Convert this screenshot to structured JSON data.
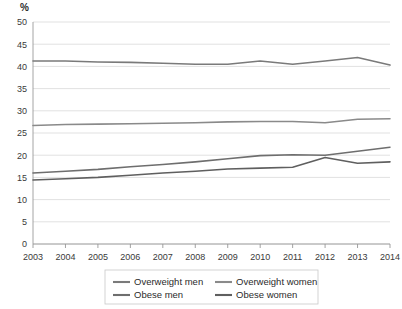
{
  "chart_data": {
    "type": "line",
    "title": "",
    "subtitle": "",
    "xlabel": "",
    "ylabel": "%",
    "unit_label": "%",
    "x": [
      2003,
      2004,
      2005,
      2006,
      2007,
      2008,
      2009,
      2010,
      2011,
      2012,
      2013,
      2014
    ],
    "categories": [
      "2003",
      "2004",
      "2005",
      "2006",
      "2007",
      "2008",
      "2009",
      "2010",
      "2011",
      "2012",
      "2013",
      "2014"
    ],
    "xlim": [
      2003,
      2014
    ],
    "ylim": [
      0,
      50
    ],
    "yticks": [
      0,
      5,
      10,
      15,
      20,
      25,
      30,
      35,
      40,
      45,
      50
    ],
    "ytick_labels": [
      "0",
      "5",
      "10",
      "15",
      "20",
      "25",
      "30",
      "35",
      "40",
      "45",
      "50"
    ],
    "grid": true,
    "grid_axis": "y",
    "legend_position": "bottom",
    "series": [
      {
        "name": "Overweight men",
        "color": "#7a7a7a",
        "values": [
          41.2,
          41.2,
          41.0,
          40.9,
          40.7,
          40.5,
          40.5,
          41.2,
          40.5,
          41.2,
          42.0,
          40.3
        ]
      },
      {
        "name": "Overweight women",
        "color": "#8a8a8a",
        "values": [
          26.7,
          26.9,
          27.0,
          27.1,
          27.2,
          27.3,
          27.5,
          27.6,
          27.6,
          27.3,
          28.1,
          28.2
        ]
      },
      {
        "name": "Obese men",
        "color": "#6e6e6e",
        "values": [
          16.0,
          16.4,
          16.8,
          17.4,
          17.9,
          18.5,
          19.2,
          19.9,
          20.1,
          20.0,
          20.9,
          21.8
        ]
      },
      {
        "name": "Obese women",
        "color": "#5f5f5f",
        "values": [
          14.4,
          14.7,
          15.0,
          15.5,
          16.0,
          16.4,
          16.9,
          17.1,
          17.3,
          19.5,
          18.2,
          18.5
        ]
      }
    ]
  },
  "legend": {
    "entries": [
      {
        "label": "Overweight men"
      },
      {
        "label": "Overweight women"
      },
      {
        "label": "Obese men"
      },
      {
        "label": "Obese women"
      }
    ]
  },
  "colors": {
    "grid": "#d4d4d4",
    "axis": "#9a9a9a",
    "text": "#2b2b2b",
    "background": "#ffffff"
  }
}
